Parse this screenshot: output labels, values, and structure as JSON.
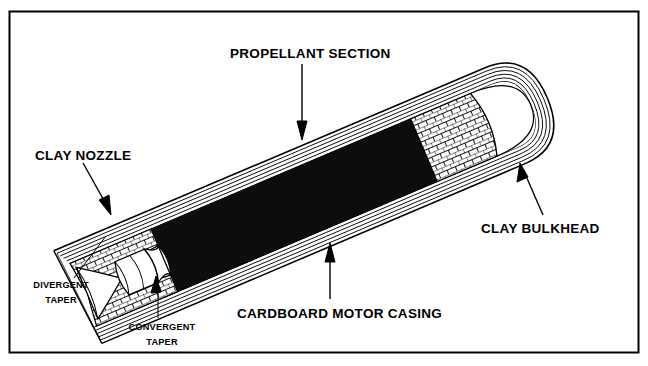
{
  "figure": {
    "background_color": "#ffffff",
    "line_color": "#000000",
    "propellant_color": "#0d0d0d",
    "border": {
      "color": "#000000",
      "width_px": 2
    }
  },
  "labels": {
    "propellant_section": "PROPELLANT SECTION",
    "clay_nozzle": "CLAY NOZZLE",
    "clay_bulkhead": "CLAY BULKHEAD",
    "cardboard_motor_casing": "CARDBOARD MOTOR CASING",
    "divergent_taper_line1": "DIVERGENT",
    "divergent_taper_line2": "TAPER",
    "convergent_taper_line1": "CONVERGENT",
    "convergent_taper_line2": "TAPER"
  },
  "parts": [
    {
      "id": "cardboard-motor-casing",
      "name": "Cardboard motor casing",
      "hatch": "parallel-layer-lines",
      "layers": 5
    },
    {
      "id": "clay-nozzle",
      "name": "Clay nozzle",
      "hatch": "brick-crosshatch"
    },
    {
      "id": "propellant-section",
      "name": "Propellant section",
      "fill": "solid-black"
    },
    {
      "id": "clay-bulkhead",
      "name": "Clay bulkhead",
      "hatch": "brick-crosshatch"
    },
    {
      "id": "nozzle-throat-cavity",
      "name": "Nozzle throat cavity",
      "fill": "white"
    },
    {
      "id": "divergent-taper",
      "name": "Divergent taper"
    },
    {
      "id": "convergent-taper",
      "name": "Convergent taper"
    }
  ],
  "geometry": {
    "rotation_deg": -23,
    "note": "Motor drawn as a cutaway cylinder inclined about 23 degrees above horizontal, nozzle at lower-left, closed bulkhead end at upper-right."
  }
}
